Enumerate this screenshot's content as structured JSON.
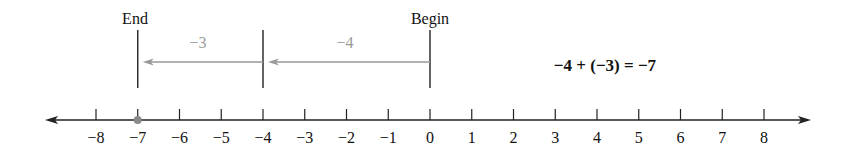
{
  "diagram": {
    "type": "number-line",
    "labels": {
      "end": "End",
      "begin": "Begin",
      "step1": "−4",
      "step2": "−3",
      "equation": "−4 + (−3) = −7"
    },
    "ticks": [
      {
        "value": -8,
        "label": "−8"
      },
      {
        "value": -7,
        "label": "−7"
      },
      {
        "value": -6,
        "label": "−6"
      },
      {
        "value": -5,
        "label": "−5"
      },
      {
        "value": -4,
        "label": "−4"
      },
      {
        "value": -3,
        "label": "−3"
      },
      {
        "value": -2,
        "label": "−2"
      },
      {
        "value": -1,
        "label": "−1"
      },
      {
        "value": 0,
        "label": "0"
      },
      {
        "value": 1,
        "label": "1"
      },
      {
        "value": 2,
        "label": "2"
      },
      {
        "value": 3,
        "label": "3"
      },
      {
        "value": 4,
        "label": "4"
      },
      {
        "value": 5,
        "label": "5"
      },
      {
        "value": 6,
        "label": "6"
      },
      {
        "value": 7,
        "label": "7"
      },
      {
        "value": 8,
        "label": "8"
      }
    ],
    "begin_value": 0,
    "middle_value": -4,
    "end_value": -7,
    "colors": {
      "axis": "#222222",
      "arrow": "#999999",
      "step_label": "#9a9a9a",
      "point": "#8a8a8a",
      "text": "#111111"
    }
  }
}
